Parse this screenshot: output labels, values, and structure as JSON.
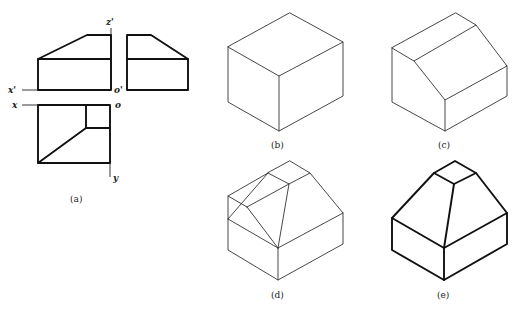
{
  "figure": {
    "panels": [
      {
        "id": "a",
        "caption": "(a)",
        "description": "Three orthographic views: front, side, top"
      },
      {
        "id": "b",
        "caption": "(b)",
        "description": "Isometric bounding box"
      },
      {
        "id": "c",
        "caption": "(c)",
        "description": "Box with sloped cut on left"
      },
      {
        "id": "d",
        "caption": "(d)",
        "description": "Construction lines of hipped top"
      },
      {
        "id": "e",
        "caption": "(e)",
        "description": "Final isometric solid"
      }
    ],
    "axis_labels": {
      "z_prime": "z'",
      "x_prime": "x'",
      "o_prime": "o'",
      "x": "x",
      "o": "o",
      "y": "y"
    }
  }
}
